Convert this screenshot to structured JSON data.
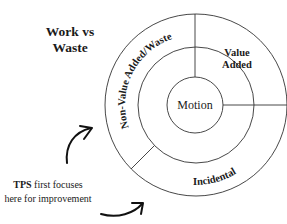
{
  "title": {
    "line1": "Work vs",
    "line2": "Waste"
  },
  "diagram": {
    "center_label": "Motion",
    "segments": [
      {
        "id": "value-added",
        "label_line1": "Value",
        "label_line2": "Added"
      },
      {
        "id": "non-value-added",
        "label": "Non-Value Added/Waste"
      },
      {
        "id": "incidental",
        "label": "Incidental"
      }
    ]
  },
  "annotation": {
    "bold": "TPS",
    "line1_rest": " first focuses",
    "line2": "here for improvement"
  }
}
